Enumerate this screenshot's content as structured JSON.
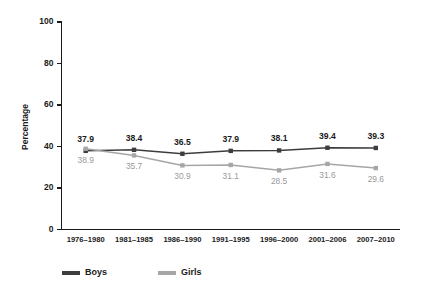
{
  "chart_data": {
    "type": "line",
    "title": "",
    "xlabel": "",
    "ylabel": "Percentage",
    "ylim": [
      0,
      100
    ],
    "yticks": [
      0,
      20,
      40,
      60,
      80,
      100
    ],
    "grid": false,
    "legend_position": "bottom",
    "categories": [
      "1976–1980",
      "1981–1985",
      "1986–1990",
      "1991–1995",
      "1996–2000",
      "2001–2006",
      "2007–2010"
    ],
    "series": [
      {
        "name": "Boys",
        "color": "#3d3d3d",
        "label_color": "#1a1a1a",
        "values": [
          37.9,
          38.4,
          36.5,
          37.9,
          38.1,
          39.4,
          39.3
        ],
        "labels": [
          "37.9",
          "38.4",
          "36.5",
          "37.9",
          "38.1",
          "39.4",
          "39.3"
        ]
      },
      {
        "name": "Girls",
        "color": "#a6a6a6",
        "label_color": "#9a9a9a",
        "values": [
          38.9,
          35.7,
          30.9,
          31.1,
          28.5,
          31.6,
          29.6
        ],
        "labels": [
          "38.9",
          "35.7",
          "30.9",
          "31.1",
          "28.5",
          "31.6",
          "29.6"
        ]
      }
    ],
    "ytick_labels": [
      "0",
      "20",
      "40",
      "60",
      "80",
      "100"
    ],
    "legend": [
      {
        "label": "Boys",
        "color": "#3d3d3d"
      },
      {
        "label": "Girls",
        "color": "#a6a6a6"
      }
    ]
  }
}
